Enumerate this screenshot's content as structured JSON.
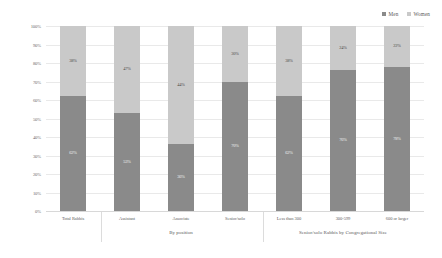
{
  "legend": {
    "position": "top-right",
    "items": [
      {
        "label": "Men",
        "color": "#8a8a8a"
      },
      {
        "label": "Women",
        "color": "#c9c9c9"
      }
    ]
  },
  "axis": {
    "yticks": [
      "100%",
      "90%",
      "80%",
      "70%",
      "60%",
      "50%",
      "40%",
      "30%",
      "20%",
      "10%",
      "0%"
    ]
  },
  "groups": [
    {
      "label": ""
    },
    {
      "label": "By position"
    },
    {
      "label": "Senior/solo Rabbis by Congregational Size"
    }
  ],
  "chart_data": {
    "type": "bar",
    "subtype": "100% stacked column",
    "title": "",
    "xlabel": "",
    "ylabel": "",
    "ylim": [
      0,
      100
    ],
    "grid": true,
    "legend_position": "top-right",
    "categories": [
      "Total Rabbis",
      "Assistant",
      "Associate",
      "Senior/solo",
      "Less than 300",
      "300-599",
      "600 or larger"
    ],
    "series": [
      {
        "name": "Men",
        "color": "#8a8a8a",
        "values": [
          62,
          53,
          36,
          70,
          62,
          76,
          78
        ],
        "labels": [
          "62%",
          "53%",
          "36%",
          "70%",
          "62%",
          "76%",
          "78%"
        ]
      },
      {
        "name": "Women",
        "color": "#c9c9c9",
        "values": [
          38,
          47,
          64,
          30,
          38,
          24,
          22
        ],
        "labels": [
          "38%",
          "47%",
          "44%",
          "30%",
          "38%",
          "24%",
          "22%"
        ]
      }
    ],
    "category_groups": [
      {
        "label": "",
        "categories": [
          "Total Rabbis"
        ]
      },
      {
        "label": "By position",
        "categories": [
          "Assistant",
          "Associate",
          "Senior/solo"
        ]
      },
      {
        "label": "Senior/solo Rabbis by Congregational Size",
        "categories": [
          "Less than 300",
          "300-599",
          "600 or larger"
        ]
      }
    ]
  }
}
